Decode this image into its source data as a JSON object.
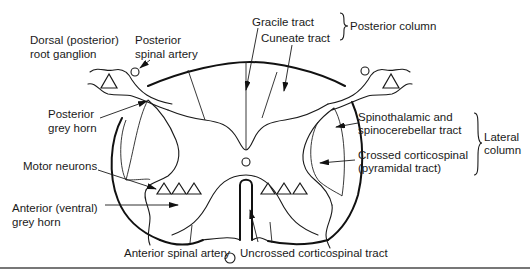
{
  "diagram": {
    "labels": {
      "dorsal_root_ganglion": [
        "Dorsal (posterior)",
        "root ganglion"
      ],
      "posterior_spinal_artery": [
        "Posterior",
        "spinal artery"
      ],
      "gracile_tract": "Gracile tract",
      "cuneate_tract": "Cuneate tract",
      "posterior_column": "Posterior column",
      "posterior_grey_horn": [
        "Posterior",
        "grey horn"
      ],
      "spinothalamic_tract": [
        "Spinothalamic and",
        "spinocerebellar tract"
      ],
      "lateral_column": [
        "Lateral",
        "column"
      ],
      "crossed_corticospinal": [
        "Crossed corticospinal",
        "(pyramidal tract)"
      ],
      "motor_neurons": "Motor neurons",
      "anterior_grey_horn": [
        "Anterior (ventral)",
        "grey horn"
      ],
      "anterior_spinal_artery": "Anterior spinal artery",
      "uncrossed_corticospinal": "Uncrossed corticospinal tract"
    },
    "colors": {
      "line": "#1a1a1a",
      "background": "#ffffff",
      "rule": "#777777"
    }
  }
}
